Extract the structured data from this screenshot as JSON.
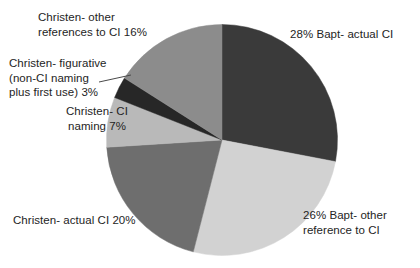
{
  "chart_data": {
    "type": "pie",
    "title": "",
    "subtitle": "",
    "xlabel": "",
    "ylabel": "",
    "legend_position": "none",
    "grid": false,
    "labels_outside": true,
    "categories": [
      "Bapt- actual CI",
      "Bapt- other reference to CI",
      "Christen- actual CI",
      "Christen- CI naming",
      "Christen- figurative (non-CI naming plus first use)",
      "Christen- other references to CI"
    ],
    "values": [
      28,
      26,
      20,
      7,
      3,
      16
    ],
    "value_unit": "%",
    "colors": [
      "#3a3a3a",
      "#d2d2d2",
      "#6e6e6e",
      "#b9b9b9",
      "#272727",
      "#8c8c8c"
    ],
    "start_angle_deg": 0,
    "direction": "clockwise",
    "slices": [
      {
        "name": "Bapt- actual CI",
        "value": 28,
        "label": "28%  Bapt- actual CI",
        "color": "#3a3a3a",
        "start_deg": 0,
        "end_deg": 100.8
      },
      {
        "name": "Bapt- other reference to CI",
        "value": 26,
        "label": "26%  Bapt- other\nreference to CI",
        "color": "#d2d2d2",
        "start_deg": 100.8,
        "end_deg": 194.4
      },
      {
        "name": "Christen- actual CI",
        "value": 20,
        "label": "Christen- actual CI  20%",
        "color": "#6e6e6e",
        "start_deg": 194.4,
        "end_deg": 266.4
      },
      {
        "name": "Christen- CI naming",
        "value": 7,
        "label": "Christen- CI\nnaming  7%",
        "color": "#b9b9b9",
        "start_deg": 266.4,
        "end_deg": 291.6
      },
      {
        "name": "Christen- figurative (non-CI naming plus first use)",
        "value": 3,
        "label": "Christen- figurative\n(non-CI naming\nplus first use)  3%",
        "color": "#272727",
        "start_deg": 291.6,
        "end_deg": 302.4
      },
      {
        "name": "Christen- other references to CI",
        "value": 16,
        "label": "Christen- other\nreferences to CI  16%",
        "color": "#8c8c8c",
        "start_deg": 302.4,
        "end_deg": 360
      }
    ]
  },
  "labels": {
    "bapt_actual": "28%  Bapt- actual CI",
    "bapt_other": "26%  Bapt- other\nreference to CI",
    "christen_actual": "Christen- actual CI  20%",
    "christen_ci_naming": "Christen- CI\nnaming  7%",
    "christen_figurative": "Christen- figurative\n(non-CI naming\nplus first use)  3%",
    "christen_other_refs": "Christen- other\nreferences to CI  16%"
  }
}
